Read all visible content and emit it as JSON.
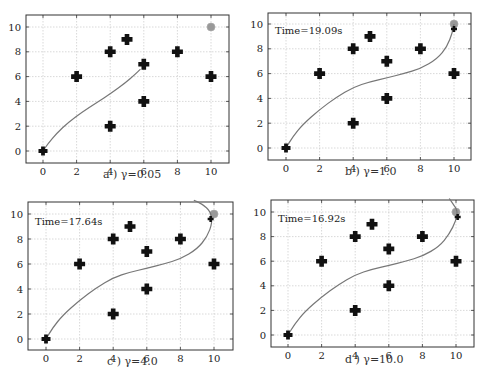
{
  "figure": {
    "footer_text": ""
  },
  "chart_data": [
    {
      "type": "scatter",
      "panel": "a",
      "caption": "a ) γ=0.05",
      "annotation": "",
      "xlim": [
        -1,
        11
      ],
      "ylim": [
        -1,
        11
      ],
      "xticks": [
        0,
        2,
        4,
        6,
        8,
        10
      ],
      "yticks": [
        0,
        2,
        4,
        6,
        8,
        10
      ],
      "grid": true,
      "start": [
        0,
        0
      ],
      "goal": [
        10,
        10
      ],
      "obstacles": [
        [
          2,
          6
        ],
        [
          4,
          8
        ],
        [
          4,
          2
        ],
        [
          5,
          9
        ],
        [
          6,
          7
        ],
        [
          6,
          4
        ],
        [
          8,
          8
        ],
        [
          10,
          6
        ]
      ],
      "trajectory": [
        [
          0,
          0
        ],
        [
          0.3,
          0.6
        ],
        [
          0.8,
          1.4
        ],
        [
          1.5,
          2.3
        ],
        [
          2.3,
          3.1
        ],
        [
          3.2,
          3.9
        ],
        [
          4.1,
          4.7
        ],
        [
          4.9,
          5.5
        ],
        [
          5.5,
          6.2
        ],
        [
          5.8,
          6.6
        ]
      ],
      "layout": {
        "left": 0,
        "top": 0,
        "frame": [
          26,
          15,
          229,
          163
        ],
        "x0": 43,
        "x10": 211,
        "y0": 151,
        "y10": 27,
        "caption_xy": [
          103,
          168
        ]
      }
    },
    {
      "type": "scatter",
      "panel": "b",
      "caption": "b ) γ=1.0",
      "annotation": "Time=19.09s",
      "xlim": [
        -1,
        11
      ],
      "ylim": [
        -1,
        11
      ],
      "xticks": [
        0,
        2,
        4,
        6,
        8,
        10
      ],
      "yticks": [
        0,
        2,
        4,
        6,
        8,
        10
      ],
      "grid": true,
      "start": [
        0,
        0
      ],
      "goal": [
        10,
        10
      ],
      "obstacles": [
        [
          2,
          6
        ],
        [
          4,
          8
        ],
        [
          4,
          2
        ],
        [
          5,
          9
        ],
        [
          6,
          7
        ],
        [
          6,
          4
        ],
        [
          8,
          8
        ],
        [
          10,
          6
        ],
        [
          10,
          9.6
        ]
      ],
      "trajectory": [
        [
          0,
          0
        ],
        [
          0.4,
          0.9
        ],
        [
          1,
          1.9
        ],
        [
          2,
          3.1
        ],
        [
          3,
          4.1
        ],
        [
          4,
          4.9
        ],
        [
          5,
          5.35
        ],
        [
          6,
          5.65
        ],
        [
          7,
          6
        ],
        [
          8,
          6.4
        ],
        [
          9,
          7.2
        ],
        [
          9.6,
          8.2
        ],
        [
          9.9,
          9.3
        ],
        [
          10,
          10
        ]
      ],
      "layout": {
        "left": 243,
        "top": 0,
        "frame": [
          268,
          13,
          471,
          160
        ],
        "x0": 286,
        "x10": 454,
        "y0": 148,
        "y10": 24,
        "caption_xy": [
          345,
          165
        ]
      }
    },
    {
      "type": "scatter",
      "panel": "c",
      "caption": "c ) γ=4.0",
      "annotation": "Time=17.64s",
      "xlim": [
        -1,
        11
      ],
      "ylim": [
        -1,
        11
      ],
      "xticks": [
        0,
        2,
        4,
        6,
        8,
        10
      ],
      "yticks": [
        0,
        2,
        4,
        6,
        8,
        10
      ],
      "grid": true,
      "start": [
        0,
        0
      ],
      "goal": [
        10,
        10
      ],
      "obstacles": [
        [
          2,
          6
        ],
        [
          4,
          8
        ],
        [
          4,
          2
        ],
        [
          5,
          9
        ],
        [
          6,
          7
        ],
        [
          6,
          4
        ],
        [
          8,
          8
        ],
        [
          10,
          6
        ],
        [
          9.8,
          9.6
        ]
      ],
      "trajectory": [
        [
          0,
          0
        ],
        [
          0.4,
          0.9
        ],
        [
          1,
          1.9
        ],
        [
          2,
          3.1
        ],
        [
          3,
          4.1
        ],
        [
          4,
          4.9
        ],
        [
          5,
          5.35
        ],
        [
          6,
          5.65
        ],
        [
          7,
          6
        ],
        [
          8,
          6.4
        ],
        [
          9,
          7.2
        ],
        [
          9.6,
          8.2
        ],
        [
          9.9,
          9.3
        ],
        [
          9.8,
          10.2
        ],
        [
          9.3,
          10.8
        ],
        [
          8.8,
          11.1
        ]
      ],
      "layout": {
        "left": 0,
        "top": 195,
        "frame": [
          28,
          202,
          233,
          350
        ],
        "x0": 46,
        "x10": 214,
        "y0": 339,
        "y10": 214,
        "caption_xy": [
          107,
          355
        ]
      }
    },
    {
      "type": "scatter",
      "panel": "d",
      "caption": "d ) γ=10.0",
      "annotation": "Time=16.92s",
      "xlim": [
        -1,
        11
      ],
      "ylim": [
        -1,
        11
      ],
      "xticks": [
        0,
        2,
        4,
        6,
        8,
        10
      ],
      "yticks": [
        0,
        2,
        4,
        6,
        8,
        10
      ],
      "grid": true,
      "start": [
        0,
        0
      ],
      "goal": [
        10,
        10
      ],
      "obstacles": [
        [
          2,
          6
        ],
        [
          4,
          8
        ],
        [
          4,
          2
        ],
        [
          5,
          9
        ],
        [
          6,
          7
        ],
        [
          6,
          4
        ],
        [
          8,
          8
        ],
        [
          10,
          6
        ],
        [
          10.1,
          9.6
        ]
      ],
      "trajectory": [
        [
          0,
          0
        ],
        [
          0.4,
          0.9
        ],
        [
          1,
          1.9
        ],
        [
          2,
          3.1
        ],
        [
          3,
          4.1
        ],
        [
          4,
          4.9
        ],
        [
          5,
          5.35
        ],
        [
          6,
          5.65
        ],
        [
          7,
          6
        ],
        [
          8,
          6.4
        ],
        [
          9,
          7.2
        ],
        [
          9.6,
          8.2
        ],
        [
          10,
          9.3
        ],
        [
          10.1,
          10.1
        ],
        [
          9.8,
          10.7
        ],
        [
          9.6,
          11.1
        ]
      ],
      "layout": {
        "left": 243,
        "top": 195,
        "frame": [
          271,
          200,
          474,
          347
        ],
        "x0": 288,
        "x10": 456,
        "y0": 335,
        "y10": 212,
        "caption_xy": [
          345,
          353
        ]
      }
    }
  ],
  "colors": {
    "axis": "#333333",
    "grid": "#c8c8c8",
    "trajectory": "#777777",
    "obstacle": "#111111",
    "goal": "#999999",
    "text": "#222222"
  }
}
